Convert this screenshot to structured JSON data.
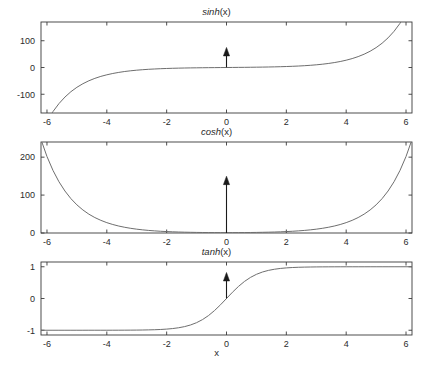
{
  "figure": {
    "width": 433,
    "height": 377,
    "background": "#ffffff",
    "axis_color": "#3a3a3a",
    "curve_color": "#6e6e6e",
    "annotation_color": "#1a1a1a",
    "shared_xlabel": "x"
  },
  "chart_data": [
    {
      "type": "line",
      "title": "sinh(x)",
      "title_fn": "sinh",
      "title_arg": "(x)",
      "xlabel": "",
      "ylabel": "",
      "xlim": [
        -6.2,
        6.2
      ],
      "ylim": [
        -170,
        170
      ],
      "xticks": [
        -6,
        -4,
        -2,
        0,
        2,
        4,
        6
      ],
      "xticklabels": [
        "-6",
        "-4",
        "-2",
        "0",
        "2",
        "4",
        "6"
      ],
      "yticks": [
        -100,
        0,
        100
      ],
      "yticklabels": [
        "-100",
        "0",
        "100"
      ],
      "grid": false,
      "legend": null,
      "annotations": [
        {
          "type": "arrow",
          "x": 0,
          "y_start": 0,
          "y_end": 75,
          "direction": "up",
          "label": ""
        }
      ],
      "x": [
        -6.2,
        -6,
        -5.8,
        -5.6,
        -5.4,
        -5.2,
        -5,
        -4.8,
        -4.6,
        -4.4,
        -4.2,
        -4,
        -3.8,
        -3.6,
        -3.4,
        -3.2,
        -3,
        -2.8,
        -2.6,
        -2.4,
        -2.2,
        -2,
        -1.8,
        -1.6,
        -1.4,
        -1.2,
        -1,
        -0.8,
        -0.6,
        -0.4,
        -0.2,
        0,
        0.2,
        0.4,
        0.6,
        0.8,
        1,
        1.2,
        1.4,
        1.6,
        1.8,
        2,
        2.2,
        2.4,
        2.6,
        2.8,
        3,
        3.2,
        3.4,
        3.6,
        3.8,
        4,
        4.2,
        4.4,
        4.6,
        4.8,
        5,
        5.2,
        5.4,
        5.6,
        5.8,
        6,
        6.2
      ],
      "values": [
        -245.8,
        -201.2,
        -164.7,
        -134.9,
        -110.4,
        -90.4,
        -74.0,
        -60.6,
        -49.6,
        -40.6,
        -33.2,
        -27.3,
        -22.3,
        -18.3,
        -14.9,
        -12.2,
        -10.0,
        -8.2,
        -6.7,
        -5.5,
        -4.5,
        -3.63,
        -2.94,
        -2.38,
        -1.9,
        -1.51,
        -1.18,
        -0.888,
        -0.637,
        -0.411,
        -0.201,
        0,
        0.201,
        0.411,
        0.637,
        0.888,
        1.18,
        1.51,
        1.9,
        2.38,
        2.94,
        3.63,
        4.46,
        5.47,
        6.69,
        8.19,
        10.02,
        12.25,
        14.97,
        18.29,
        22.34,
        27.29,
        33.34,
        40.72,
        49.74,
        60.75,
        74.2,
        90.63,
        110.7,
        135.21,
        165.15,
        201.71,
        246.37
      ]
    },
    {
      "type": "line",
      "title": "cosh(x)",
      "title_fn": "cosh",
      "title_arg": "(x)",
      "xlabel": "",
      "ylabel": "",
      "xlim": [
        -6.2,
        6.2
      ],
      "ylim": [
        0,
        240
      ],
      "xticks": [
        -6,
        -4,
        -2,
        0,
        2,
        4,
        6
      ],
      "xticklabels": [
        "-6",
        "-4",
        "-2",
        "0",
        "2",
        "4",
        "6"
      ],
      "yticks": [
        0,
        100,
        200
      ],
      "yticklabels": [
        "0",
        "100",
        "200"
      ],
      "grid": false,
      "legend": null,
      "annotations": [
        {
          "type": "arrow",
          "x": 0,
          "y_start": 0,
          "y_end": 150,
          "direction": "up",
          "label": ""
        }
      ],
      "x": [
        -6.2,
        -6,
        -5.8,
        -5.6,
        -5.4,
        -5.2,
        -5,
        -4.8,
        -4.6,
        -4.4,
        -4.2,
        -4,
        -3.8,
        -3.6,
        -3.4,
        -3.2,
        -3,
        -2.8,
        -2.6,
        -2.4,
        -2.2,
        -2,
        -1.8,
        -1.6,
        -1.4,
        -1.2,
        -1,
        -0.8,
        -0.6,
        -0.4,
        -0.2,
        0,
        0.2,
        0.4,
        0.6,
        0.8,
        1,
        1.2,
        1.4,
        1.6,
        1.8,
        2,
        2.2,
        2.4,
        2.6,
        2.8,
        3,
        3.2,
        3.4,
        3.6,
        3.8,
        4,
        4.2,
        4.4,
        4.6,
        4.8,
        5,
        5.2,
        5.4,
        5.6,
        5.8,
        6,
        6.2
      ],
      "values": [
        246.4,
        201.7,
        165.1,
        135.2,
        110.7,
        90.6,
        74.2,
        60.8,
        49.7,
        40.7,
        33.4,
        27.3,
        22.4,
        18.3,
        15.0,
        12.3,
        10.07,
        8.25,
        6.77,
        5.56,
        4.57,
        3.76,
        3.11,
        2.58,
        2.15,
        1.81,
        1.54,
        1.34,
        1.19,
        1.08,
        1.02,
        1.0,
        1.02,
        1.08,
        1.19,
        1.34,
        1.54,
        1.81,
        2.15,
        2.58,
        3.11,
        3.76,
        4.57,
        5.56,
        6.77,
        8.25,
        10.07,
        12.29,
        15.0,
        18.31,
        22.36,
        27.31,
        33.35,
        40.73,
        49.75,
        60.76,
        74.21,
        90.64,
        110.71,
        135.22,
        165.15,
        201.72,
        246.38
      ]
    },
    {
      "type": "line",
      "title": "tanh(x)",
      "title_fn": "tanh",
      "title_arg": "(x)",
      "xlabel": "x",
      "ylabel": "",
      "xlim": [
        -6.2,
        6.2
      ],
      "ylim": [
        -1.15,
        1.15
      ],
      "xticks": [
        -6,
        -4,
        -2,
        0,
        2,
        4,
        6
      ],
      "xticklabels": [
        "-6",
        "-4",
        "-2",
        "0",
        "2",
        "4",
        "6"
      ],
      "yticks": [
        -1,
        0,
        1
      ],
      "yticklabels": [
        "-1",
        "0",
        "1"
      ],
      "grid": false,
      "legend": null,
      "annotations": [
        {
          "type": "arrow",
          "x": 0,
          "y_start": 0,
          "y_end": 0.82,
          "direction": "up",
          "label": ""
        }
      ],
      "x": [
        -6.2,
        -6,
        -5.8,
        -5.6,
        -5.4,
        -5.2,
        -5,
        -4.8,
        -4.6,
        -4.4,
        -4.2,
        -4,
        -3.8,
        -3.6,
        -3.4,
        -3.2,
        -3,
        -2.8,
        -2.6,
        -2.4,
        -2.2,
        -2,
        -1.8,
        -1.6,
        -1.4,
        -1.2,
        -1,
        -0.8,
        -0.6,
        -0.4,
        -0.2,
        0,
        0.2,
        0.4,
        0.6,
        0.8,
        1,
        1.2,
        1.4,
        1.6,
        1.8,
        2,
        2.2,
        2.4,
        2.6,
        2.8,
        3,
        3.2,
        3.4,
        3.6,
        3.8,
        4,
        4.2,
        4.4,
        4.6,
        4.8,
        5,
        5.2,
        5.4,
        5.6,
        5.8,
        6,
        6.2
      ],
      "values": [
        -1.0,
        -1.0,
        -1.0,
        -1.0,
        -1.0,
        -1.0,
        -0.9999,
        -0.9999,
        -0.9998,
        -0.9997,
        -0.9996,
        -0.9993,
        -0.999,
        -0.9985,
        -0.9978,
        -0.9967,
        -0.9951,
        -0.9926,
        -0.989,
        -0.9837,
        -0.9757,
        -0.964,
        -0.9468,
        -0.9217,
        -0.8854,
        -0.8337,
        -0.7616,
        -0.664,
        -0.537,
        -0.3799,
        -0.1974,
        0,
        0.1974,
        0.3799,
        0.537,
        0.664,
        0.7616,
        0.8337,
        0.8854,
        0.9217,
        0.9468,
        0.964,
        0.9757,
        0.9837,
        0.989,
        0.9926,
        0.9951,
        0.9967,
        0.9978,
        0.9985,
        0.999,
        0.9993,
        0.9996,
        0.9997,
        0.9998,
        0.9999,
        0.9999,
        1.0,
        1.0,
        1.0,
        1.0,
        1.0,
        1.0
      ]
    }
  ]
}
